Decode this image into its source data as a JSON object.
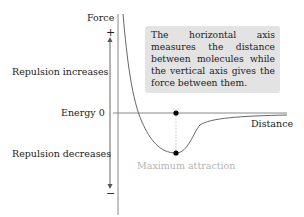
{
  "axes": {
    "vertical_label": "Force",
    "horizontal_label": "Distance",
    "zero_label": "Energy 0",
    "plus_sign": "+",
    "minus_sign": "−"
  },
  "annotations": {
    "repulsion_increases": "Repulsion increases",
    "repulsion_decreases": "Repulsion decreases",
    "maximum_attraction": "Maximum attraction",
    "note": "The horizontal axis measures the distance between molecules while the vertical axis gives the force between them."
  },
  "colors": {
    "axis": "#888888",
    "curve": "#666666",
    "note_background": "#e3e3e3",
    "muted_text": "#b4b4b4",
    "dot": "#000000"
  }
}
